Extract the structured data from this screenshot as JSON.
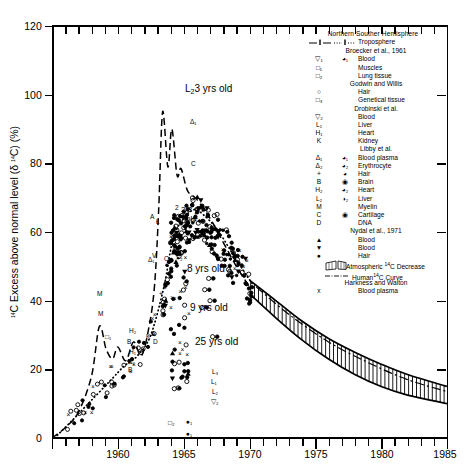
{
  "chart_data": {
    "type": "line",
    "title": "",
    "xlabel": "",
    "ylabel": "14C Excess above normal level (δ 14C) (%)",
    "xlim": [
      1955,
      1985
    ],
    "ylim": [
      0,
      120
    ],
    "xticks": [
      1960,
      1965,
      1970,
      1975,
      1980,
      1985
    ],
    "yticks": [
      0,
      20,
      40,
      60,
      80,
      100,
      120
    ],
    "grid": false,
    "legend_position": "top-right-inside",
    "series": [
      {
        "name": "Troposphere Northern Hemisphere (Broecker et al., 1961)",
        "style": "dashed",
        "points": [
          [
            1955.0,
            0.0
          ],
          [
            1956.0,
            3.0
          ],
          [
            1957.0,
            7.5
          ],
          [
            1958.0,
            18.0
          ],
          [
            1958.6,
            32.5
          ],
          [
            1959.1,
            26.0
          ],
          [
            1959.6,
            23.0
          ],
          [
            1960.0,
            26.5
          ],
          [
            1960.6,
            22.5
          ],
          [
            1961.2,
            28.0
          ],
          [
            1961.8,
            24.0
          ],
          [
            1962.4,
            33.0
          ],
          [
            1962.8,
            45.0
          ],
          [
            1963.1,
            66.0
          ],
          [
            1963.4,
            95.0
          ],
          [
            1963.8,
            79.0
          ],
          [
            1964.1,
            90.0
          ],
          [
            1964.5,
            76.5
          ],
          [
            1964.8,
            78.5
          ],
          [
            1965.3,
            72.0
          ],
          [
            1966.0,
            69.5
          ],
          [
            1967.0,
            64.0
          ],
          [
            1968.0,
            57.0
          ],
          [
            1969.0,
            50.0
          ],
          [
            1970.0,
            44.0
          ]
        ]
      },
      {
        "name": "Troposphere Southern Hemisphere (Broecker et al., 1961)",
        "style": "dotted",
        "points": [
          [
            1955.2,
            0.0
          ],
          [
            1956.5,
            5.0
          ],
          [
            1958.0,
            11.0
          ],
          [
            1959.5,
            17.0
          ],
          [
            1960.5,
            21.0
          ],
          [
            1961.5,
            24.0
          ],
          [
            1962.5,
            30.0
          ],
          [
            1963.5,
            44.0
          ],
          [
            1964.2,
            58.0
          ],
          [
            1965.0,
            64.0
          ],
          [
            1965.8,
            66.5
          ],
          [
            1966.5,
            65.0
          ],
          [
            1967.5,
            61.0
          ],
          [
            1968.5,
            55.0
          ],
          [
            1969.5,
            49.0
          ],
          [
            1970.2,
            45.0
          ]
        ]
      },
      {
        "name": "Atmospheric 14C Decrease (upper bound)",
        "style": "solid",
        "points": [
          [
            1970.0,
            46.0
          ],
          [
            1972.0,
            40.0
          ],
          [
            1974.0,
            34.0
          ],
          [
            1976.0,
            29.0
          ],
          [
            1978.0,
            25.0
          ],
          [
            1980.0,
            21.5
          ],
          [
            1982.0,
            18.5
          ],
          [
            1985.0,
            15.0
          ]
        ]
      },
      {
        "name": "Atmospheric 14C Decrease (lower bound)",
        "style": "solid",
        "points": [
          [
            1970.0,
            42.0
          ],
          [
            1972.0,
            35.0
          ],
          [
            1974.0,
            28.5
          ],
          [
            1976.0,
            23.0
          ],
          [
            1978.0,
            18.5
          ],
          [
            1980.0,
            15.0
          ],
          [
            1982.0,
            12.5
          ],
          [
            1985.0,
            10.0
          ]
        ]
      },
      {
        "name": "Human 14C Curve",
        "style": "dash-dot",
        "points": [
          [
            1970.5,
            44.0
          ],
          [
            1973.0,
            36.0
          ],
          [
            1976.0,
            28.0
          ],
          [
            1979.0,
            22.0
          ],
          [
            1982.0,
            17.0
          ],
          [
            1985.0,
            13.5
          ]
        ]
      }
    ],
    "annotations": [
      {
        "text": "L23 yrs old",
        "x": 1966.0,
        "y": 88.0
      },
      {
        "text": "2 3 yrs old",
        "x": 1966.6,
        "y": 60.5
      },
      {
        "text": "8 yrs old",
        "x": 1967.4,
        "y": 46.5
      },
      {
        "text": "9 yrs old",
        "x": 1967.6,
        "y": 39.5
      },
      {
        "text": "25 yrs old",
        "x": 1967.9,
        "y": 29.5
      }
    ]
  },
  "axes": {
    "y_title_pre": "C Excess above normal level (",
    "y_title_sup": "14",
    "y_title_delta": "δ ",
    "y_title_mid": "C) (%)",
    "y_labels": [
      "120",
      "100",
      "80",
      "60",
      "40",
      "20",
      "0"
    ],
    "x_labels": [
      "1960",
      "1965",
      "1970",
      "1975",
      "1980",
      "1985"
    ]
  },
  "legend": {
    "header": "Northern Souther Hemisphere",
    "rows": [
      {
        "kind": "tropo",
        "north": "",
        "south": "",
        "text": "Troposphere"
      },
      {
        "kind": "center",
        "text": "Broecker et al., 1961"
      },
      {
        "kind": "sym",
        "north": "▽₁",
        "south": "◕₁",
        "text": "Blood"
      },
      {
        "kind": "sym",
        "north": "□₁",
        "south": "",
        "text": "Muscles"
      },
      {
        "kind": "sym",
        "north": "□₂",
        "south": "",
        "text": "Lung tissue"
      },
      {
        "kind": "center",
        "text": "Godwin and Willis"
      },
      {
        "kind": "sym",
        "north": "○",
        "south": "",
        "text": "Hair"
      },
      {
        "kind": "sym",
        "north": "□₃",
        "south": "",
        "text": "Genetical tissue"
      },
      {
        "kind": "center",
        "text": "Drobinski et al."
      },
      {
        "kind": "sym",
        "north": "▽₂",
        "south": "",
        "text": "Blood"
      },
      {
        "kind": "sym",
        "north": "L₁",
        "south": "",
        "text": "Liver"
      },
      {
        "kind": "sym",
        "north": "H₁",
        "south": "",
        "text": "Heart"
      },
      {
        "kind": "sym",
        "north": "K",
        "south": "",
        "text": "Kidney"
      },
      {
        "kind": "center",
        "text": "Libby et al."
      },
      {
        "kind": "sym",
        "north": "Δ₁",
        "south": "◕₁",
        "text": "Blood plasma"
      },
      {
        "kind": "sym",
        "north": "Δ₂",
        "south": "◕₂",
        "text": "Erythrocyte"
      },
      {
        "kind": "sym",
        "north": "+",
        "south": "◕",
        "text": "Hair"
      },
      {
        "kind": "sym",
        "north": "B",
        "south": "◉",
        "text": "Brain"
      },
      {
        "kind": "sym",
        "north": "H₂",
        "south": "◕₂",
        "text": "Heart"
      },
      {
        "kind": "sym",
        "north": "L₂",
        "south": "◑₂",
        "text": "Liver"
      },
      {
        "kind": "sym",
        "north": "M",
        "south": "",
        "text": "Myelin"
      },
      {
        "kind": "sym",
        "north": "C",
        "south": "◉",
        "text": "Cartilage"
      },
      {
        "kind": "sym",
        "north": "D",
        "south": "",
        "text": "DNA"
      },
      {
        "kind": "center",
        "text": "Nydal et al., 1971"
      },
      {
        "kind": "sym",
        "north": "▲",
        "south": "",
        "text": "Blood"
      },
      {
        "kind": "sym",
        "north": "▼",
        "south": "",
        "text": "Blood"
      },
      {
        "kind": "sym",
        "north": "●",
        "south": "",
        "text": "Hair"
      },
      {
        "kind": "hatch",
        "text_pre": "Atmospheric ",
        "text_sup": "14",
        "text_post": "C Decrease"
      },
      {
        "kind": "dashdot",
        "text_pre": "Human",
        "text_sup": "14",
        "text_post": "C Curve"
      },
      {
        "kind": "center",
        "text": "Harkness and Walton"
      },
      {
        "kind": "sym",
        "north": "x",
        "south": "",
        "text": "Blood plasma"
      }
    ]
  },
  "plot_labels": {
    "l2_3yrs": "L₂3 yrs old",
    "two_three_yrs_line1": "2 3 yrs",
    "two_three_yrs_line2": "old",
    "eight_yrs": "8 yrs old",
    "nine_yrs": "9 yrs old",
    "twentyfive_yrs": "25 yrs old"
  },
  "inline_point_labels": [
    "Δ₁",
    "Δ₁",
    "Δ₂",
    "O₁",
    "◕₂",
    "C",
    "M",
    "M",
    "H₂",
    "H₁",
    "B",
    "B",
    "D",
    "A",
    "K",
    "L₁",
    "L₂",
    "L₃",
    "▽₂",
    "□₂",
    "●₁",
    "●₁",
    "□₁",
    "+₂",
    "₂",
    "×",
    "×"
  ],
  "colors": {
    "ink": "#000000",
    "background": "#ffffff"
  }
}
